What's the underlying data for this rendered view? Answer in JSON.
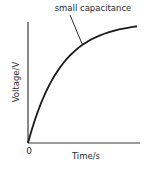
{
  "chart_data": {
    "type": "line",
    "title": "",
    "xlabel": "Time/s",
    "ylabel": "Voltage/V",
    "origin_label": "0",
    "xlim": [
      0,
      1
    ],
    "ylim": [
      0,
      1
    ],
    "grid": false,
    "series": [
      {
        "name": "small capacitance",
        "function": "1 - exp(-t/tau)",
        "tau": 0.3,
        "x": [
          0,
          0.1,
          0.2,
          0.3,
          0.4,
          0.5,
          0.6,
          0.7,
          0.8,
          0.9,
          1.0
        ],
        "y": [
          0,
          0.28,
          0.49,
          0.63,
          0.74,
          0.81,
          0.86,
          0.9,
          0.93,
          0.95,
          0.96
        ]
      }
    ],
    "annotations": [
      {
        "text": "small capacitance",
        "points_to_series": "small capacitance",
        "at_x": 0.5
      }
    ]
  }
}
